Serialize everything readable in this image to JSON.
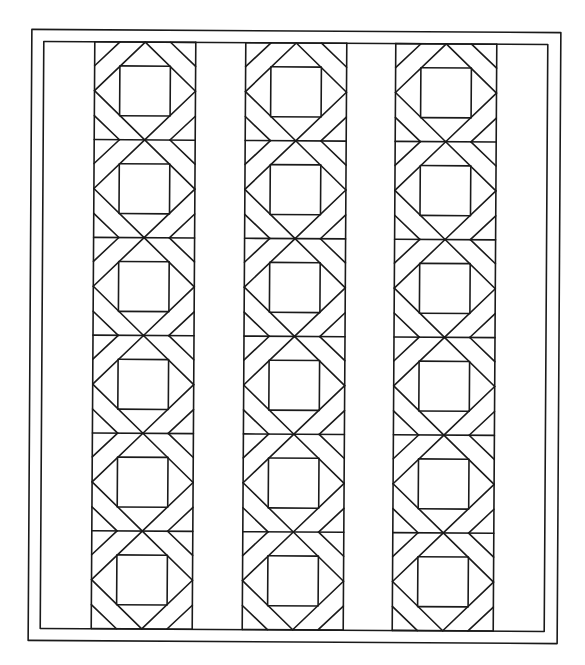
{
  "title": "",
  "quilt": {
    "description": "Quilt pattern line drawing: three vertical pieced strips of six blocks each, separated by plain sashing, with a double border",
    "stroke_color": "#1a1a1a",
    "background": "#ffffff",
    "rotation_deg": 0.35,
    "outer_border": {
      "x": 30,
      "y": 31,
      "w": 529,
      "h": 611
    },
    "inner_border": {
      "x": 42,
      "y": 43,
      "w": 504,
      "h": 587
    },
    "strips": [
      {
        "x": 93,
        "w": 101
      },
      {
        "x": 244,
        "w": 101
      },
      {
        "x": 394,
        "w": 101
      }
    ],
    "block_count": 6,
    "block_top": 43,
    "block_height": 97.8,
    "block_parts": [
      "corner-band",
      "diamond",
      "center-square"
    ]
  }
}
